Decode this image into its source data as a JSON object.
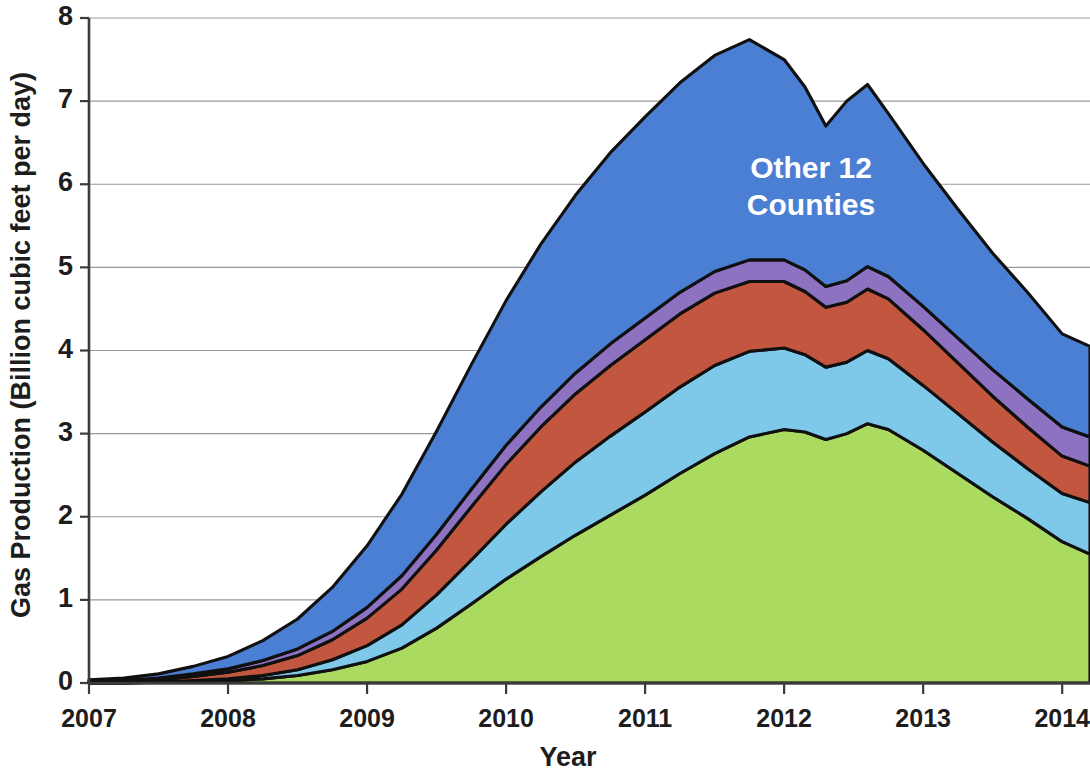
{
  "chart_data": {
    "type": "area",
    "stacked": true,
    "title": "",
    "xlabel": "Year",
    "ylabel": "Gas Production (Billion cubic feet per day)",
    "xlim": [
      2007,
      2014.2
    ],
    "ylim": [
      0,
      8
    ],
    "ytick_values": [
      0,
      1,
      2,
      3,
      4,
      5,
      6,
      7,
      8
    ],
    "ytick_labels": [
      "0",
      "1",
      "2",
      "3",
      "4",
      "5",
      "6",
      "7",
      "8"
    ],
    "xtick_values": [
      2007,
      2008,
      2009,
      2010,
      2011,
      2012,
      2013,
      2014
    ],
    "xtick_labels": [
      "2007",
      "2008",
      "2009",
      "2010",
      "2011",
      "2012",
      "2013",
      "2014"
    ],
    "grid": "horizontal",
    "legend_position": "top-left",
    "stack_order_bottom_to_top": [
      "DeSoto Parish",
      "Red River Parish",
      "Caddo Parish",
      "Panola County",
      "Other 12 Counties"
    ],
    "x": [
      2007.0,
      2007.25,
      2007.5,
      2007.75,
      2008.0,
      2008.25,
      2008.5,
      2008.75,
      2009.0,
      2009.25,
      2009.5,
      2009.75,
      2010.0,
      2010.25,
      2010.5,
      2010.75,
      2011.0,
      2011.25,
      2011.5,
      2011.75,
      2012.0,
      2012.15,
      2012.3,
      2012.45,
      2012.6,
      2012.75,
      2013.0,
      2013.25,
      2013.5,
      2013.75,
      2014.0,
      2014.2
    ],
    "series": [
      {
        "name": "DeSoto Parish",
        "color": "#aada5f",
        "label_in_chart": "DeSoto",
        "values": [
          0.0,
          0.0,
          0.01,
          0.02,
          0.03,
          0.05,
          0.09,
          0.16,
          0.26,
          0.42,
          0.66,
          0.95,
          1.25,
          1.52,
          1.78,
          2.02,
          2.26,
          2.52,
          2.76,
          2.96,
          3.05,
          3.02,
          2.93,
          3.0,
          3.12,
          3.05,
          2.8,
          2.52,
          2.24,
          1.98,
          1.7,
          1.55
        ]
      },
      {
        "name": "Red River Parish",
        "color": "#7ec9ea",
        "label_in_chart": "Red River",
        "values": [
          0.0,
          0.0,
          0.0,
          0.01,
          0.02,
          0.04,
          0.07,
          0.12,
          0.19,
          0.28,
          0.4,
          0.53,
          0.66,
          0.78,
          0.88,
          0.95,
          1.0,
          1.04,
          1.06,
          1.03,
          0.98,
          0.93,
          0.87,
          0.86,
          0.88,
          0.85,
          0.78,
          0.72,
          0.66,
          0.6,
          0.58,
          0.62
        ]
      },
      {
        "name": "Caddo Parish",
        "color": "#c2563f",
        "label_in_chart": "Caddo",
        "values": [
          0.01,
          0.02,
          0.03,
          0.05,
          0.08,
          0.12,
          0.17,
          0.24,
          0.33,
          0.43,
          0.54,
          0.64,
          0.72,
          0.78,
          0.82,
          0.85,
          0.87,
          0.88,
          0.87,
          0.84,
          0.8,
          0.76,
          0.72,
          0.72,
          0.74,
          0.72,
          0.67,
          0.61,
          0.55,
          0.5,
          0.45,
          0.44
        ]
      },
      {
        "name": "Panola County",
        "color": "#8e72c2",
        "label_in_chart": "Panola",
        "values": [
          0.01,
          0.01,
          0.02,
          0.03,
          0.04,
          0.06,
          0.08,
          0.1,
          0.13,
          0.16,
          0.19,
          0.21,
          0.23,
          0.24,
          0.25,
          0.26,
          0.26,
          0.26,
          0.26,
          0.26,
          0.26,
          0.26,
          0.25,
          0.26,
          0.27,
          0.27,
          0.28,
          0.3,
          0.32,
          0.34,
          0.35,
          0.35
        ]
      },
      {
        "name": "Other 12 Counties",
        "color": "#4a7fd4",
        "label_in_chart": "Other 12 Counties",
        "values": [
          0.02,
          0.03,
          0.05,
          0.09,
          0.15,
          0.24,
          0.36,
          0.53,
          0.74,
          0.98,
          1.24,
          1.5,
          1.74,
          1.96,
          2.14,
          2.3,
          2.42,
          2.52,
          2.6,
          2.65,
          2.41,
          2.2,
          1.93,
          2.16,
          2.19,
          1.96,
          1.72,
          1.55,
          1.4,
          1.28,
          1.12,
          1.09
        ]
      }
    ],
    "annotations": [
      {
        "id": "peak-annotation",
        "text": "Peak January 2012",
        "x": 2011.0,
        "y": 7.72,
        "arrow_to_x": 2011.98,
        "arrow_to_y": 7.62
      },
      {
        "id": "decline-annotation",
        "line1": "Production",
        "line2": "Down 46%",
        "x": 2013.55,
        "y": 6.95,
        "arrow_to_x": 2014.05,
        "arrow_to_y": 4.25
      }
    ],
    "callout": {
      "title": "Current Production",
      "lines": [
        "Top county = 37%",
        "Top 2 counties = 56%",
        "Top 4 counties = 74%"
      ]
    }
  },
  "legend": {
    "items": [
      {
        "label": "Other 12 Counties",
        "color": "#4a7fd4"
      },
      {
        "label": "Panola County",
        "color": "#8e72c2"
      },
      {
        "label": "Caddo Parish",
        "color": "#c2563f"
      },
      {
        "label": "Red River Parish",
        "color": "#7ec9ea"
      },
      {
        "label": "DeSoto Parish",
        "color": "#aada5f"
      }
    ]
  }
}
